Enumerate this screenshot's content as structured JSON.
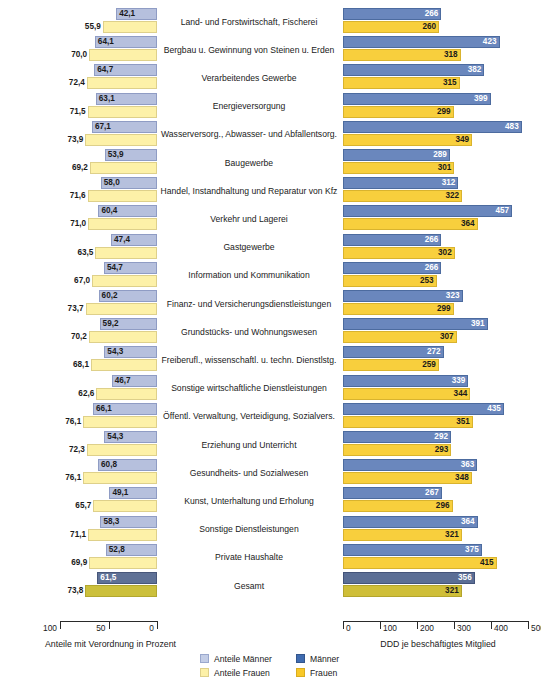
{
  "chart_data": {
    "type": "bar",
    "title": "",
    "orientation": "horizontal-diverging-pair",
    "categories": [
      "Land- und Forstwirtschaft, Fischerei",
      "Bergbau u. Gewinnung von Steinen u. Erden",
      "Verarbeitendes Gewerbe",
      "Energieversorgung",
      "Wasserversorg., Abwasser- und Abfallentsorg.",
      "Baugewerbe",
      "Handel, Instandhaltung und Reparatur von Kfz",
      "Verkehr und Lagerei",
      "Gastgewerbe",
      "Information und Kommunikation",
      "Finanz- und Versicherungsdienstleistungen",
      "Grundstücks- und Wohnungswesen",
      "Freiberufl., wissenschaftl. u. techn. Dienstlstg.",
      "Sonstige wirtschaftliche Dienstleistungen",
      "Öffentl. Verwaltung, Verteidigung, Sozialvers.",
      "Erziehung und Unterricht",
      "Gesundheits- und Sozialwesen",
      "Kunst, Unterhaltung und Erholung",
      "Sonstige Dienstleistungen",
      "Private Haushalte",
      "Gesamt"
    ],
    "series": [
      {
        "name": "Anteile Männer",
        "panel": "left",
        "unit": "Prozent",
        "values": [
          42.1,
          64.1,
          64.7,
          63.1,
          67.1,
          53.9,
          58.0,
          60.4,
          47.4,
          54.7,
          60.2,
          59.2,
          54.3,
          46.7,
          66.1,
          54.3,
          60.8,
          49.1,
          58.3,
          52.8,
          61.5
        ],
        "labels": [
          "42,1",
          "64,1",
          "64,7",
          "63,1",
          "67,1",
          "53,9",
          "58,0",
          "60,4",
          "47,4",
          "54,7",
          "60,2",
          "59,2",
          "54,3",
          "46,7",
          "66,1",
          "54,3",
          "60,8",
          "49,1",
          "58,3",
          "52,8",
          "61,5"
        ],
        "color": "#b6c0dd"
      },
      {
        "name": "Anteile Frauen",
        "panel": "left",
        "unit": "Prozent",
        "values": [
          55.9,
          70.0,
          72.4,
          71.5,
          73.9,
          69.2,
          71.6,
          71.0,
          63.5,
          67.0,
          73.7,
          70.2,
          68.1,
          62.6,
          76.1,
          72.3,
          76.1,
          65.7,
          71.1,
          69.9,
          73.8
        ],
        "labels": [
          "55,9",
          "70,0",
          "72,4",
          "71,5",
          "73,9",
          "69,2",
          "71,6",
          "71,0",
          "63,5",
          "67,0",
          "73,7",
          "70,2",
          "68,1",
          "62,6",
          "76,1",
          "72,3",
          "76,1",
          "65,7",
          "71,1",
          "69,9",
          "73,8"
        ],
        "color": "#fdf1a8"
      },
      {
        "name": "Männer",
        "panel": "right",
        "unit": "DDD je beschäftigtes Mitglied",
        "values": [
          266,
          423,
          382,
          399,
          483,
          289,
          312,
          457,
          266,
          266,
          323,
          391,
          272,
          339,
          435,
          292,
          363,
          267,
          364,
          375,
          356
        ],
        "labels": [
          "266",
          "423",
          "382",
          "399",
          "483",
          "289",
          "312",
          "457",
          "266",
          "266",
          "323",
          "391",
          "272",
          "339",
          "435",
          "292",
          "363",
          "267",
          "364",
          "375",
          "356"
        ],
        "color": "#6a87bd"
      },
      {
        "name": "Frauen",
        "panel": "right",
        "unit": "DDD je beschäftigtes Mitglied",
        "values": [
          260,
          318,
          315,
          299,
          349,
          301,
          322,
          364,
          302,
          253,
          299,
          307,
          259,
          344,
          351,
          293,
          348,
          296,
          321,
          415,
          321
        ],
        "labels": [
          "260",
          "318",
          "315",
          "299",
          "349",
          "301",
          "322",
          "364",
          "302",
          "253",
          "299",
          "307",
          "259",
          "344",
          "351",
          "293",
          "348",
          "296",
          "321",
          "415",
          "321"
        ],
        "color": "#f8cf3d"
      }
    ],
    "left_axis": {
      "title": "Anteile mit Verordnung in Prozent",
      "ticks": [
        100,
        50,
        0
      ],
      "tick_labels": [
        "100",
        "50",
        "0"
      ],
      "range": [
        100,
        0
      ],
      "direction": "right-to-left"
    },
    "right_axis": {
      "title": "DDD je beschäftigtes Mitglied",
      "ticks": [
        0,
        100,
        200,
        300,
        400,
        500
      ],
      "tick_labels": [
        "0",
        "100",
        "200",
        "300",
        "400",
        "500"
      ],
      "range": [
        0,
        500
      ],
      "direction": "left-to-right"
    },
    "legend": {
      "position": "bottom-center",
      "entries": [
        {
          "label": "Anteile Männer",
          "color": "#c3cde6"
        },
        {
          "label": "Anteile Frauen",
          "color": "#fdf1a8"
        },
        {
          "label": "Männer",
          "color": "#3f6bb0"
        },
        {
          "label": "Frauen",
          "color": "#f8c828"
        }
      ]
    },
    "grid": false
  }
}
